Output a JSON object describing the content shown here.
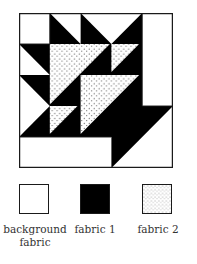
{
  "diagram": {
    "type": "quilt-block",
    "grid": 5,
    "colors": {
      "background": "#ffffff",
      "fabric1": "#000000",
      "fabric2_base": "#ffffff",
      "fabric2_dot": "#222222",
      "border": "#1a1a1a"
    }
  },
  "legend": [
    {
      "key": "background",
      "label_line1": "background",
      "label_line2": "fabric"
    },
    {
      "key": "fabric1",
      "label_line1": "fabric 1",
      "label_line2": ""
    },
    {
      "key": "fabric2",
      "label_line1": "fabric 2",
      "label_line2": ""
    }
  ]
}
